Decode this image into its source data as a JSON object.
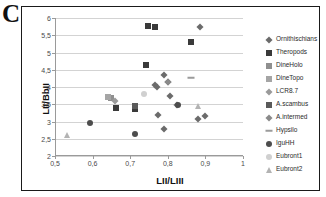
{
  "panel": {
    "letter": "C"
  },
  "chart_data": {
    "type": "scatter",
    "title": "",
    "xlabel": "LII/LIII",
    "ylabel": "LII/BbII",
    "xlim": [
      0.5,
      1
    ],
    "ylim": [
      2,
      6
    ],
    "xticks": [
      "0,5",
      "0,6",
      "0,7",
      "0,8",
      "0,9",
      "1"
    ],
    "xtick_values": [
      0.5,
      0.6,
      0.7,
      0.8,
      0.9,
      1.0
    ],
    "yticks": [
      "2",
      "2,5",
      "3",
      "3,5",
      "4",
      "4,5",
      "5",
      "5,5",
      "6"
    ],
    "ytick_values": [
      2,
      2.5,
      3,
      3.5,
      4,
      4.5,
      5,
      5.5,
      6
    ],
    "grid": "horizontal",
    "legend_position": "right",
    "series": [
      {
        "name": "Ornithischians",
        "marker": "diamond",
        "color": "#6b6b6b",
        "points": [
          [
            0.885,
            5.75
          ],
          [
            0.79,
            4.34
          ],
          [
            0.8,
            4.15
          ],
          [
            0.765,
            4.05
          ],
          [
            0.772,
            4.0
          ],
          [
            0.805,
            3.74
          ],
          [
            0.825,
            3.48
          ],
          [
            0.775,
            3.19
          ],
          [
            0.898,
            3.17
          ],
          [
            0.88,
            3.08
          ],
          [
            0.79,
            2.78
          ]
        ]
      },
      {
        "name": "Theropods",
        "marker": "square",
        "color": "#3a3a3a",
        "points": [
          [
            0.748,
            5.76
          ],
          [
            0.765,
            5.73
          ],
          [
            0.862,
            5.29
          ],
          [
            0.742,
            4.64
          ],
          [
            0.712,
            3.37
          ],
          [
            0.663,
            3.4
          ]
        ]
      },
      {
        "name": "DineHolo",
        "marker": "square",
        "color": "#8f8f8f",
        "points": [
          [
            0.648,
            3.68
          ]
        ]
      },
      {
        "name": "DineTopo",
        "marker": "square",
        "color": "#a5a5a5",
        "points": [
          [
            0.64,
            3.7
          ]
        ]
      },
      {
        "name": "LCR8.7",
        "marker": "diamond",
        "color": "#9a9a9a",
        "points": [
          [
            0.66,
            3.6
          ]
        ]
      },
      {
        "name": "A.scambus",
        "marker": "square",
        "color": "#5a5a5a",
        "points": [
          [
            0.712,
            3.45
          ]
        ]
      },
      {
        "name": "A.intermed",
        "marker": "diamond",
        "color": "#8a8a8a",
        "points": [
          [
            0.8,
            4.15
          ]
        ]
      },
      {
        "name": "Hypsilo",
        "marker": "dash",
        "color": "#9b9b9b",
        "points": [
          [
            0.862,
            4.27
          ]
        ]
      },
      {
        "name": "IguHH",
        "marker": "circle",
        "color": "#4d4d4d",
        "points": [
          [
            0.592,
            2.95
          ],
          [
            0.712,
            2.65
          ],
          [
            0.828,
            3.47
          ]
        ]
      },
      {
        "name": "Eubront1",
        "marker": "circle",
        "color": "#d0d0d0",
        "points": [
          [
            0.738,
            3.8
          ]
        ]
      },
      {
        "name": "Eubront2",
        "marker": "triangle",
        "color": "#b3b3b3",
        "points": [
          [
            0.88,
            3.45
          ],
          [
            0.533,
            2.62
          ]
        ]
      }
    ]
  }
}
